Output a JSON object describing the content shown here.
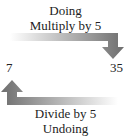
{
  "top_label_1": "Doing",
  "top_label_2": "Multiply by 5",
  "left_value": "7",
  "right_value": "35",
  "bottom_label_1": "Divide by 5",
  "bottom_label_2": "Undoing",
  "colors": {
    "arrow": "#6e6e6e",
    "text": "#222222"
  }
}
